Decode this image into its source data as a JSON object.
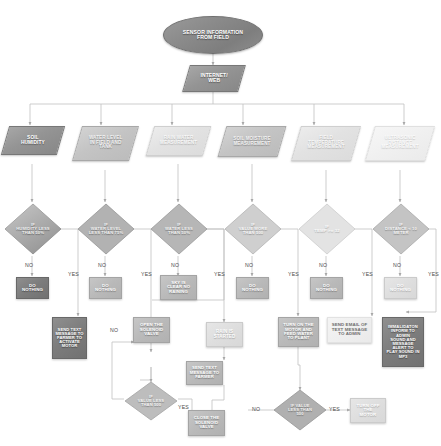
{
  "diagram": {
    "type": "flowchart",
    "nodes": {
      "start": {
        "label": "SENSOR INFORMATION\nFROM FIELD",
        "shape": "terminator"
      },
      "internet": {
        "label": "INTERNET/\nWEB",
        "shape": "io"
      },
      "soil_humidity": {
        "label": "SOIL\nHUMIDITY",
        "shape": "io"
      },
      "water_level": {
        "label": "WATER LEVEL\nIN FIELD AND\nTANK",
        "shape": "io"
      },
      "rain_water": {
        "label": "RAIN WATER\nMEASUREMENT",
        "shape": "io"
      },
      "soil_moisture": {
        "label": "SOIL MOISTURE\nMEASUREMENT",
        "shape": "io"
      },
      "field_temp": {
        "label": "FIELD\nTEMPERATURE\nMEASUREMENT",
        "shape": "io"
      },
      "ultrasonic": {
        "label": "ULTRASONIC\nDISTANCE\nMEASUREMENT",
        "shape": "io"
      },
      "dec_humidity": {
        "label": "IF\nHUMIDITY LESS\nTHAN 50%",
        "shape": "decision"
      },
      "dec_water_level": {
        "label": "IF\nWATER LEVEL\nLESS THAN 75%",
        "shape": "decision"
      },
      "dec_water_less": {
        "label": "IF\nWATER LESS\nTHAN 50%",
        "shape": "decision"
      },
      "dec_value_more": {
        "label": "IF\nVALUE MORE\nTHAN 500",
        "shape": "decision"
      },
      "dec_temp": {
        "label": "IF\nTEMP >= 32",
        "shape": "decision"
      },
      "dec_distance": {
        "label": "IF\nDISTANCE < 10\nMETER",
        "shape": "decision"
      },
      "dn1": {
        "label": "DO\nNOTHING",
        "shape": "process"
      },
      "dn2": {
        "label": "DO\nNOTHING",
        "shape": "process"
      },
      "sky_clear": {
        "label": "SKY IS\nCLEAR NO\nRAINING",
        "shape": "process"
      },
      "dn4": {
        "label": "DO\nNOTHING",
        "shape": "process"
      },
      "dn5": {
        "label": "DO\nNOTHING",
        "shape": "process"
      },
      "dn6": {
        "label": "DO\nNOTHING",
        "shape": "process"
      },
      "send_text_motor": {
        "label": "SEND TEXT\nMESSAGE TO\nFARMER TO\nACTIVATE\nMOTOR",
        "shape": "process"
      },
      "open_valve": {
        "label": "OPEN THE\nSOLENOID\nVALVE",
        "shape": "process"
      },
      "rain_started": {
        "label": "RAIN IS\nSTARTED",
        "shape": "process"
      },
      "turn_on_motor": {
        "label": "TURN ON THE\nMOTOR AND\nFEED WATER\nTO PLANT",
        "shape": "process"
      },
      "send_email_admin": {
        "label": "SEND EMAIL OF\nTEXT MESSAGE\nTO ADMIN",
        "shape": "process"
      },
      "immediate_alert": {
        "label": "IMMALIDATON\nINFORM TO ADMIN\nSOUND AND\nMESSAGE\nALERT TO\nPLAY SOUND IN\nMP3",
        "shape": "process"
      },
      "send_text_farmer": {
        "label": "SEND TEXT\nMESSAGE TO\nFARMER",
        "shape": "process"
      },
      "dec_value_less_500_left": {
        "label": "IF\nVALUE LESS\nTHAN 500",
        "shape": "decision"
      },
      "close_valve": {
        "label": "CLOSE THE\nSOLENOID\nVALVE",
        "shape": "process"
      },
      "dec_value_less_500_right": {
        "label": "IF VALUE\nLESS THAN\n500",
        "shape": "decision"
      },
      "turn_off_motor": {
        "label": "TURN OFF\nTHE\nMOTOR",
        "shape": "process"
      }
    },
    "edge_labels": {
      "no1": "NO",
      "yes1": "YES",
      "no2": "NO",
      "yes2": "YES",
      "no3": "NO",
      "yes3": "YES",
      "no4": "NO",
      "yes4": "YES",
      "no5": "NO",
      "yes5": "YES",
      "no6": "NO",
      "yes6": "YES",
      "no_left_valve": "NO",
      "yes_left_valve": "YES",
      "no_right_motor": "NO",
      "yes_right_motor": "YES"
    },
    "colors": {
      "line": "#b9b9b9",
      "text_dark": "#4a4a4a",
      "node_dark": "#7c7c7c",
      "node_mid": "#b9b9b9",
      "node_light": "#dedede",
      "background": "#ffffff"
    }
  }
}
